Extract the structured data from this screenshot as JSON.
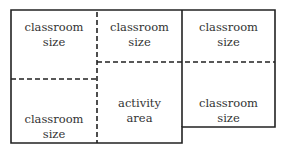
{
  "diagram": {
    "rooms": [
      {
        "line1": "classroom",
        "line2": "size"
      },
      {
        "line1": "classroom",
        "line2": "size"
      },
      {
        "line1": "classroom",
        "line2": "size"
      },
      {
        "line1": "classroom",
        "line2": "size"
      },
      {
        "line1": "activity",
        "line2": "area"
      },
      {
        "line1": "classroom",
        "line2": "size"
      }
    ]
  }
}
